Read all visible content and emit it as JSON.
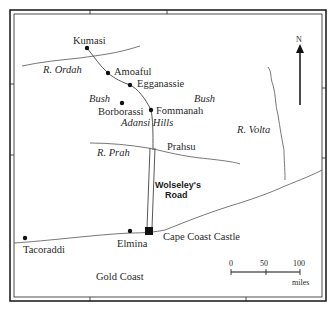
{
  "map": {
    "towns": [
      {
        "name": "Kumasi",
        "x": 87,
        "y": 48,
        "lx": 73,
        "ly": 44
      },
      {
        "name": "Amoaful",
        "x": 108,
        "y": 73,
        "lx": 114,
        "ly": 75
      },
      {
        "name": "Egganassie",
        "x": 130,
        "y": 85,
        "lx": 137,
        "ly": 87
      },
      {
        "name": "Borborassi",
        "x": 122,
        "y": 103,
        "lx": 98,
        "ly": 115
      },
      {
        "name": "Fommanah",
        "x": 151,
        "y": 110,
        "lx": 156,
        "ly": 114
      },
      {
        "name": "Tacoraddi",
        "x": 25,
        "y": 238,
        "lx": 23,
        "ly": 253
      },
      {
        "name": "Elmina",
        "x": 130,
        "y": 233,
        "lx": 117,
        "ly": 247
      }
    ],
    "labels": {
      "r_ordah": "R. Ordah",
      "r_prah": "R. Prah",
      "r_volta": "R. Volta",
      "bush_left": "Bush",
      "bush_right": "Bush",
      "adansi_hills": "Adansi Hills",
      "prahsu": "Prahsu",
      "road_line1": "Wolseley's",
      "road_line2": "Road",
      "cape_coast_castle": "Cape Coast Castle",
      "gold_coast": "Gold Coast"
    },
    "north_arrow": {
      "label": "N"
    },
    "scale_bar": {
      "ticks": [
        "0",
        "50",
        "100"
      ],
      "unit": "miles"
    },
    "colors": {
      "ink": "#222222",
      "line": "#555555",
      "background": "#ffffff"
    }
  }
}
